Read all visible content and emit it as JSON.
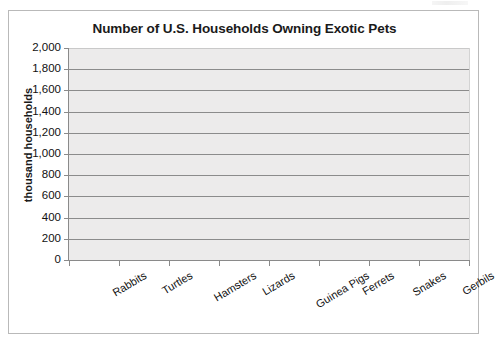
{
  "chart_data": {
    "type": "bar",
    "title": "Number of U.S. Households Owning Exotic Pets",
    "xlabel": "",
    "ylabel": "thousand households",
    "categories": [
      "Rabbits",
      "Turtles",
      "Hamsters",
      "Lizards",
      "Guinea Pigs",
      "Ferrets",
      "Snakes",
      "Gerbils"
    ],
    "values": [
      null,
      null,
      null,
      null,
      null,
      null,
      null,
      null
    ],
    "ylim": [
      0,
      2000
    ],
    "ytick_step": 200,
    "ytick_labels": [
      "2,000",
      "1,800",
      "1,600",
      "1,400",
      "1,200",
      "1,000",
      "800",
      "600",
      "400",
      "200",
      "0"
    ],
    "ytick_values": [
      2000,
      1800,
      1600,
      1400,
      1200,
      1000,
      800,
      600,
      400,
      200,
      0
    ],
    "grid": true,
    "legend": false,
    "legend_position": "none",
    "note": "Blank chart template - axes and gridlines drawn, no bars plotted",
    "colors": {
      "plot_background": "#ecebeb",
      "gridline": "#8b8b8b",
      "axis": "#8a8a8a",
      "text": "#111111",
      "frame_border": "#b9b9b9",
      "page_background": "#ffffff"
    }
  }
}
